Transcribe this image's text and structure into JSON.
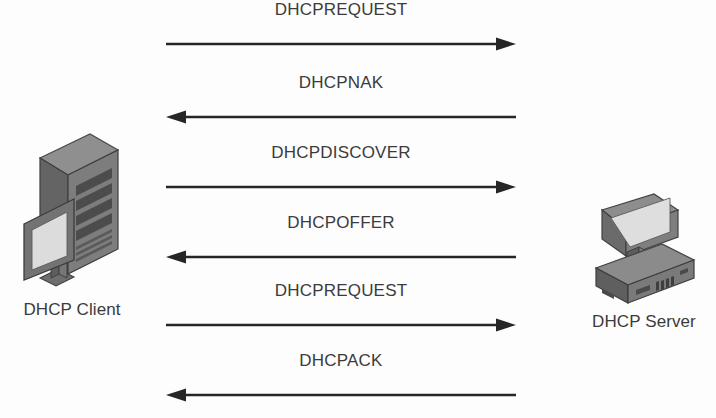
{
  "diagram": {
    "background_color": "#fdfdfd",
    "line_color": "#262626",
    "text_color": "#3b3b3b"
  },
  "nodes": {
    "client": {
      "label": "DHCP Client",
      "icon": "desktop-tower-computer-icon"
    },
    "server": {
      "label": "DHCP Server",
      "icon": "server-desktop-computer-icon"
    }
  },
  "messages": [
    {
      "label": "DHCPREQUEST",
      "direction": "right",
      "from": "client",
      "to": "server"
    },
    {
      "label": "DHCPNAK",
      "direction": "left",
      "from": "server",
      "to": "client"
    },
    {
      "label": "DHCPDISCOVER",
      "direction": "right",
      "from": "client",
      "to": "server"
    },
    {
      "label": "DHCPOFFER",
      "direction": "left",
      "from": "server",
      "to": "client"
    },
    {
      "label": "DHCPREQUEST",
      "direction": "right",
      "from": "client",
      "to": "server"
    },
    {
      "label": "DHCPACK",
      "direction": "left",
      "from": "server",
      "to": "client"
    }
  ]
}
